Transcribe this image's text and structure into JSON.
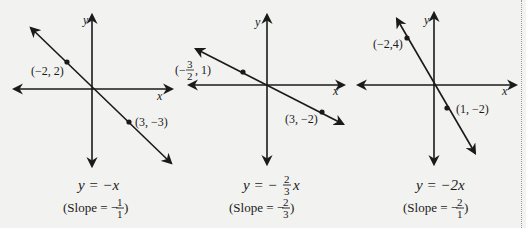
{
  "figure": {
    "panels": [
      {
        "axis_x_label": "x",
        "axis_y_label": "y",
        "points": [
          {
            "label": "(−2, 2)",
            "x": -2,
            "y": 2
          },
          {
            "label": "(3, −3)",
            "x": 3,
            "y": -3
          }
        ],
        "equation": {
          "lhs": "y = ",
          "rhs": "−x"
        },
        "slope": {
          "prefix": "(Slope = −",
          "num": "1",
          "den": "1",
          "suffix": ")"
        }
      },
      {
        "axis_x_label": "x",
        "axis_y_label": "y",
        "points": [
          {
            "label_prefix": "(−",
            "num": "3",
            "den": "2",
            "label_suffix": ", 1)",
            "x": -1.5,
            "y": 1
          },
          {
            "label": "(3, −2)",
            "x": 3,
            "y": -2
          }
        ],
        "equation": {
          "lhs": "y = −",
          "num": "2",
          "den": "3",
          "rhs": "x"
        },
        "slope": {
          "prefix": "(Slope = −",
          "num": "2",
          "den": "3",
          "suffix": ")"
        }
      },
      {
        "axis_x_label": "x",
        "axis_y_label": "y",
        "points": [
          {
            "label": "(−2,4)",
            "x": -2,
            "y": 4
          },
          {
            "label": "(1, −2)",
            "x": 1,
            "y": -2
          }
        ],
        "equation": {
          "lhs": "y = ",
          "rhs": "−2x"
        },
        "slope": {
          "prefix": "(Slope = −",
          "num": "2",
          "den": "1",
          "suffix": ")"
        }
      }
    ]
  }
}
